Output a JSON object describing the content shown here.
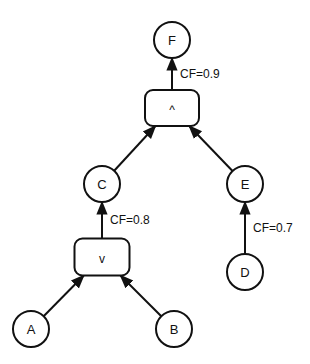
{
  "diagram": {
    "nodes": [
      {
        "id": "F",
        "label": "F",
        "kind": "circle"
      },
      {
        "id": "AND",
        "label": "^",
        "kind": "box"
      },
      {
        "id": "C",
        "label": "C",
        "kind": "circle"
      },
      {
        "id": "E",
        "label": "E",
        "kind": "circle"
      },
      {
        "id": "OR",
        "label": "v",
        "kind": "box"
      },
      {
        "id": "D",
        "label": "D",
        "kind": "circle"
      },
      {
        "id": "A",
        "label": "A",
        "kind": "circle"
      },
      {
        "id": "B",
        "label": "B",
        "kind": "circle"
      }
    ],
    "edges": [
      {
        "from": "AND",
        "to": "F",
        "label": "CF=0.9"
      },
      {
        "from": "C",
        "to": "AND",
        "label": ""
      },
      {
        "from": "E",
        "to": "AND",
        "label": ""
      },
      {
        "from": "OR",
        "to": "C",
        "label": "CF=0.8"
      },
      {
        "from": "D",
        "to": "E",
        "label": "CF=0.7"
      },
      {
        "from": "A",
        "to": "OR",
        "label": ""
      },
      {
        "from": "B",
        "to": "OR",
        "label": ""
      }
    ]
  }
}
